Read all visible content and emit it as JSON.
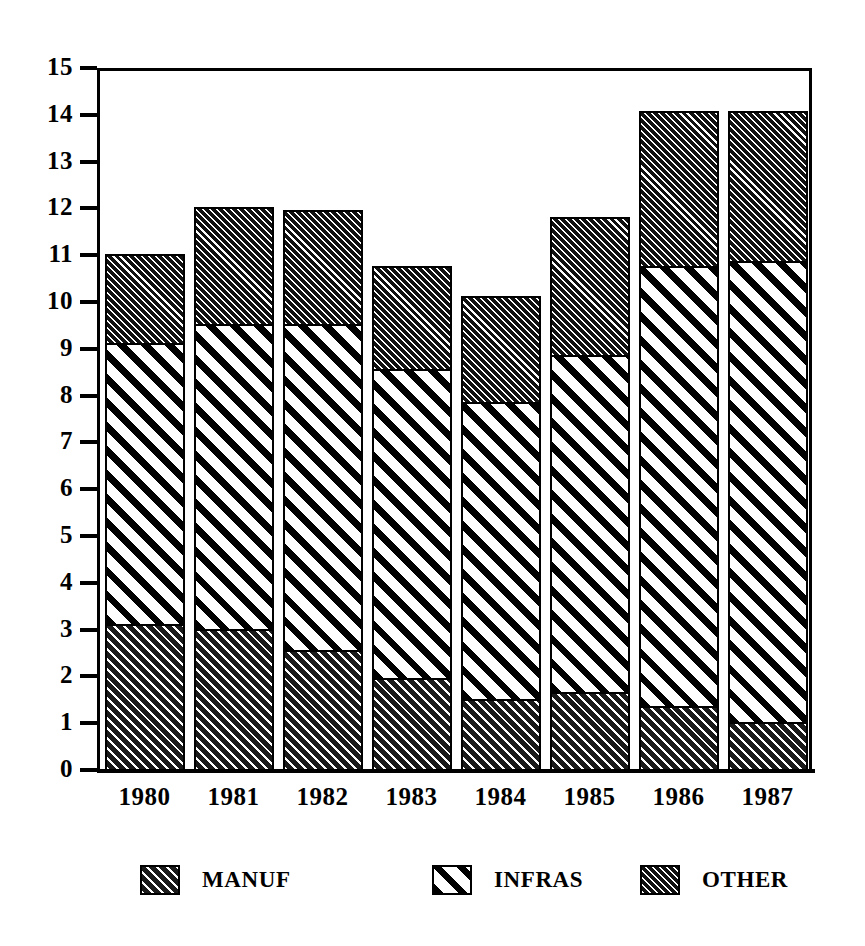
{
  "chart_data": {
    "type": "bar",
    "subtype": "stacked",
    "title": "",
    "xlabel": "",
    "ylabel": "",
    "categories": [
      "1980",
      "1981",
      "1982",
      "1983",
      "1984",
      "1985",
      "1986",
      "1987"
    ],
    "series": [
      {
        "name": "MANUF",
        "values": [
          3.1,
          3.0,
          2.55,
          1.95,
          1.5,
          1.65,
          1.35,
          1.0
        ]
      },
      {
        "name": "INFRAS",
        "values": [
          6.0,
          6.5,
          6.95,
          6.6,
          6.35,
          7.2,
          9.4,
          9.85
        ]
      },
      {
        "name": "OTHER",
        "values": [
          1.9,
          2.5,
          2.45,
          2.2,
          2.25,
          2.95,
          3.3,
          3.2
        ]
      }
    ],
    "totals": [
      11.0,
      12.0,
      11.95,
      10.75,
      10.1,
      11.8,
      14.05,
      14.05
    ],
    "cumulative_tops": {
      "manuf": [
        3.1,
        3.0,
        2.55,
        1.95,
        1.5,
        1.65,
        1.35,
        1.0
      ],
      "infras": [
        9.1,
        9.5,
        9.5,
        8.55,
        7.85,
        8.85,
        10.75,
        10.85
      ],
      "other": [
        11.0,
        12.0,
        11.95,
        10.75,
        10.1,
        11.8,
        14.05,
        14.05
      ]
    },
    "ylim": [
      0,
      15
    ],
    "yticks": [
      "15",
      "14",
      "13",
      "12",
      "11",
      "10",
      "9",
      "8",
      "7",
      "6",
      "5",
      "4",
      "3",
      "2",
      "1",
      "0"
    ],
    "ytick_values": [
      15,
      14,
      13,
      12,
      11,
      10,
      9,
      8,
      7,
      6,
      5,
      4,
      3,
      2,
      1,
      0
    ],
    "grid": false,
    "legend_position": "bottom"
  },
  "legend": {
    "items": [
      {
        "label": "MANUF",
        "pattern": "dense-diagonal-hatch-dark"
      },
      {
        "label": "INFRAS",
        "pattern": "wide-white-diagonal-stripes"
      },
      {
        "label": "OTHER",
        "pattern": "fine-dense-hatch-dark"
      }
    ]
  },
  "colors": {
    "ink": "#000000",
    "paper": "#ffffff",
    "manuf_fill": "#1a1a1a",
    "infras_fill": "#ffffff",
    "other_fill": "#111111"
  }
}
